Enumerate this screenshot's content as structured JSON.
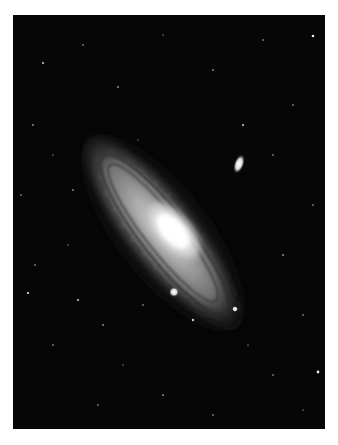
{
  "image": {
    "subject": "Andromeda Galaxy (spiral galaxy) with two satellite galaxies",
    "description": "Black-and-white astronomical photograph of a large inclined spiral galaxy with a bright elliptical core, dark dust lanes, a bright elongated companion galaxy at upper right, and a compact companion below the core, set against a star-filled black sky.",
    "colors": {
      "background": "#ffffff",
      "sky": "#060606",
      "core": "#ffffff",
      "disk": "#8a8a8a",
      "dust_lanes": "#2a2a2a"
    }
  }
}
